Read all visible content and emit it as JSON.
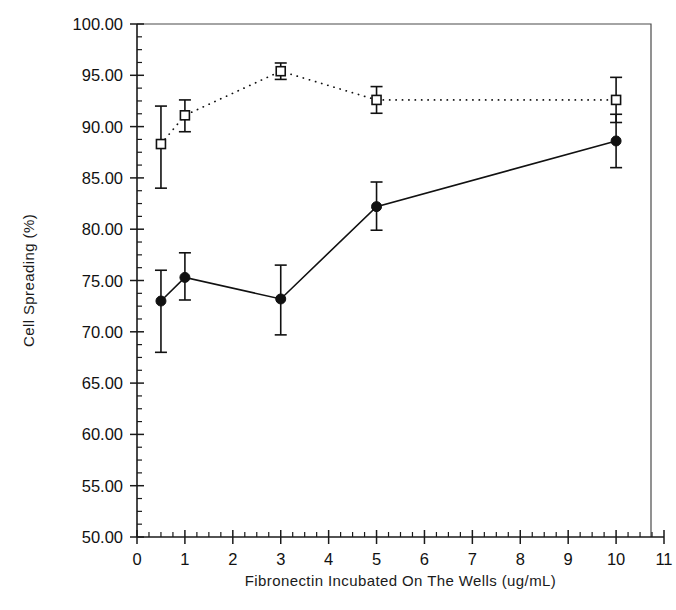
{
  "chart_data": {
    "type": "line",
    "title": "",
    "xlabel": "Fibronectin Incubated On The Wells (ug/mL)",
    "ylabel": "Cell Spreading (%)",
    "xlim": [
      0,
      11
    ],
    "ylim": [
      50,
      100
    ],
    "grid": false,
    "legend_position": "none",
    "x_ticks": [
      0,
      1,
      2,
      3,
      4,
      5,
      6,
      7,
      8,
      9,
      10,
      11
    ],
    "x_tick_labels": [
      "0",
      "1",
      "2",
      "3",
      "4",
      "5",
      "6",
      "7",
      "8",
      "9",
      "10",
      "11"
    ],
    "x_minor_tick_step": 0.25,
    "y_ticks": [
      50,
      55,
      60,
      65,
      70,
      75,
      80,
      85,
      90,
      95,
      100
    ],
    "y_tick_labels": [
      "50.00",
      "55.00",
      "60.00",
      "65.00",
      "70.00",
      "75.00",
      "80.00",
      "85.00",
      "90.00",
      "95.00",
      "100.00"
    ],
    "y_minor_tick_step": 1.25,
    "x": [
      0.5,
      1,
      3,
      5,
      10
    ],
    "series": [
      {
        "name": "open-square-dotted",
        "marker": "open-square",
        "linestyle": "dotted",
        "values": [
          88.3,
          91.1,
          95.4,
          92.6,
          92.6
        ],
        "error_upper": [
          3.7,
          1.5,
          0.8,
          1.3,
          2.2
        ],
        "error_lower": [
          4.3,
          1.6,
          0.8,
          1.3,
          2.2
        ]
      },
      {
        "name": "filled-circle-solid",
        "marker": "filled-circle",
        "linestyle": "solid",
        "values": [
          73.0,
          75.3,
          73.2,
          82.2,
          88.6
        ],
        "error_upper": [
          3.0,
          2.4,
          3.3,
          2.4,
          2.6
        ],
        "error_lower": [
          5.0,
          2.2,
          3.5,
          2.3,
          2.6
        ]
      }
    ]
  }
}
